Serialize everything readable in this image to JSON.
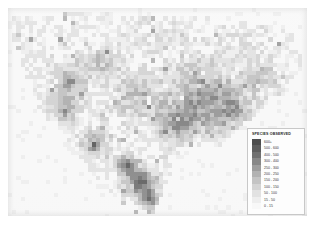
{
  "figure": {
    "kind": "choropleth-raster-map",
    "region": "North America",
    "background_color": "#f0f0f0",
    "plate_color": "#ededed"
  },
  "legend": {
    "title": "SPECIES OBSERVED",
    "box_color": "#fdfdfd",
    "border_color": "#c8c8c8",
    "entries": [
      {
        "label": "600+",
        "color": "#4d4d4d",
        "min": 600,
        "max": null
      },
      {
        "label": "500 - 600",
        "color": "#5e5e5e",
        "min": 500,
        "max": 600
      },
      {
        "label": "400 - 500",
        "color": "#707070",
        "min": 400,
        "max": 500
      },
      {
        "label": "300 - 400",
        "color": "#878787",
        "min": 300,
        "max": 400
      },
      {
        "label": "250 - 300",
        "color": "#9d9d9d",
        "min": 250,
        "max": 300
      },
      {
        "label": "200 - 250",
        "color": "#b2b2b2",
        "min": 200,
        "max": 250
      },
      {
        "label": "150 - 200",
        "color": "#c4c4c4",
        "min": 150,
        "max": 200
      },
      {
        "label": "100 - 150",
        "color": "#d4d4d4",
        "min": 100,
        "max": 150
      },
      {
        "label": "50 - 100",
        "color": "#e2e2e2",
        "min": 50,
        "max": 100
      },
      {
        "label": "15 - 50",
        "color": "#eeeeee",
        "min": 15,
        "max": 50
      },
      {
        "label": "0 - 15",
        "color": "#f8f8f8",
        "min": 0,
        "max": 15
      }
    ]
  },
  "chart_data": {
    "type": "heatmap",
    "title": "SPECIES OBSERVED",
    "xlabel": "",
    "ylabel": "",
    "grid": false,
    "legend_position": "bottom-right",
    "cell_size_px": 4.2,
    "grid_cols": 71,
    "grid_rows": 50,
    "value_unit": "species observed per grid cell",
    "value_range": [
      0,
      700
    ],
    "color_scale": "grayscale-dark-high",
    "regions": [
      {
        "name": "ocean-and-offgrid",
        "typical_value": 5,
        "color": "#f1f1f1"
      },
      {
        "name": "northern-canada",
        "typical_value": 40,
        "color": "#ebebeb"
      },
      {
        "name": "great-plains",
        "typical_value": 120,
        "color": "#d9d9d9"
      },
      {
        "name": "rocky-mountains",
        "typical_value": 180,
        "color": "#c6c6c6"
      },
      {
        "name": "pacific-coast",
        "typical_value": 260,
        "color": "#aeaeae"
      },
      {
        "name": "eastern-united-states",
        "typical_value": 230,
        "color": "#b4b4b4"
      },
      {
        "name": "gulf-coast",
        "typical_value": 300,
        "color": "#a0a0a0"
      },
      {
        "name": "southern-mexico",
        "typical_value": 560,
        "color": "#636363"
      },
      {
        "name": "gulf-of-mexico",
        "typical_value": 8,
        "color": "#f3f3f3"
      }
    ]
  },
  "map_notes": {
    "corner_mark": "",
    "caption": ""
  }
}
